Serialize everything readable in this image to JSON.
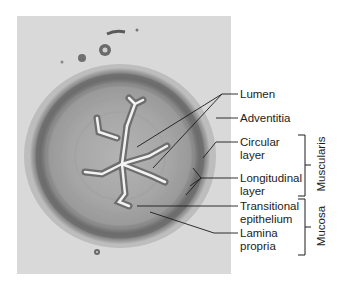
{
  "figure": {
    "background_color": "#ffffff",
    "photo_color": "#d9d9d9",
    "line_color": "#1c1c1c"
  },
  "labels": [
    {
      "id": "lumen",
      "text": "Lumen"
    },
    {
      "id": "adventitia",
      "text": "Adventitia"
    },
    {
      "id": "circular-layer",
      "text": "Circular\nlayer"
    },
    {
      "id": "longitudinal-layer",
      "text": "Longitudinal\nlayer"
    },
    {
      "id": "transitional-epithelium",
      "text": "Transitional\nepithelium"
    },
    {
      "id": "lamina-propria",
      "text": "Lamina\npropria"
    }
  ],
  "groups": [
    {
      "id": "muscularis",
      "text": "Muscularis"
    },
    {
      "id": "mucosa",
      "text": "Mucosa"
    }
  ]
}
